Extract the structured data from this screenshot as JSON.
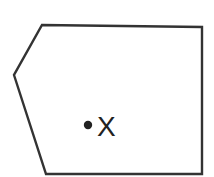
{
  "diagram": {
    "shape": {
      "type": "pentagon",
      "points": [
        [
          42,
          25
        ],
        [
          202,
          27
        ],
        [
          202,
          174
        ],
        [
          46,
          174
        ],
        [
          14,
          75
        ]
      ],
      "stroke": "#333333",
      "fill": "#ffffff"
    },
    "point": {
      "cx": 88,
      "cy": 125,
      "r": 4.2,
      "color": "#222222",
      "label": "X"
    }
  }
}
